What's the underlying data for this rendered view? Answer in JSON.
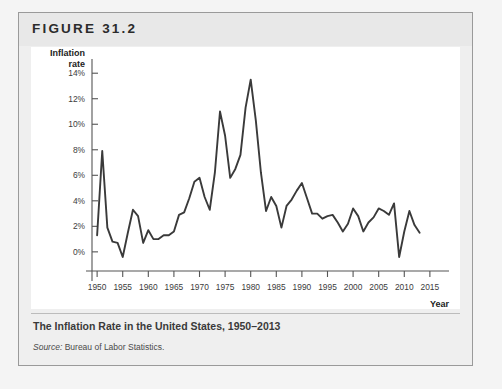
{
  "figure": {
    "label": "FIGURE 31.2",
    "caption_title": "The Inflation Rate in the United States, 1950–2013",
    "source_label": "Source:",
    "source_text": " Bureau of Labor Statistics."
  },
  "colors": {
    "line": "#3a3a3a",
    "axis": "#555555",
    "panel_background": "#ffffff",
    "header_background": "#e8e8e8",
    "box_background": "#efefef",
    "box_border": "#9a9a9a",
    "page_background": "#f4f4f4",
    "caption_rule": "#bcbcbc",
    "tick_text": "#3c3c3c"
  },
  "chart_data": {
    "type": "line",
    "title": "The Inflation Rate in the United States, 1950–2013",
    "xlabel": "Year",
    "ylabel": "Inflation rate",
    "ylabel_lines": [
      "Inflation",
      "rate"
    ],
    "xlim": [
      1949,
      2016
    ],
    "ylim": [
      -1.5,
      14.8
    ],
    "grid": false,
    "legend": "none",
    "ytick_values": [
      0,
      2,
      4,
      6,
      8,
      10,
      12,
      14
    ],
    "ytick_labels": [
      "0%",
      "2%",
      "4%",
      "6%",
      "8%",
      "10%",
      "12%",
      "14%"
    ],
    "xtick_values": [
      1950,
      1955,
      1960,
      1965,
      1970,
      1975,
      1980,
      1985,
      1990,
      1995,
      2000,
      2005,
      2010,
      2015
    ],
    "xtick_labels": [
      "1950",
      "1955",
      "1960",
      "1965",
      "1970",
      "1975",
      "1980",
      "1985",
      "1990",
      "1995",
      "2000",
      "2005",
      "2010",
      "2015"
    ],
    "series": [
      {
        "name": "US inflation rate",
        "x": [
          1950,
          1951,
          1952,
          1953,
          1954,
          1955,
          1956,
          1957,
          1958,
          1959,
          1960,
          1961,
          1962,
          1963,
          1964,
          1965,
          1966,
          1967,
          1968,
          1969,
          1970,
          1971,
          1972,
          1973,
          1974,
          1975,
          1976,
          1977,
          1978,
          1979,
          1980,
          1981,
          1982,
          1983,
          1984,
          1985,
          1986,
          1987,
          1988,
          1989,
          1990,
          1991,
          1992,
          1993,
          1994,
          1995,
          1996,
          1997,
          1998,
          1999,
          2000,
          2001,
          2002,
          2003,
          2004,
          2005,
          2006,
          2007,
          2008,
          2009,
          2010,
          2011,
          2012,
          2013
        ],
        "values": [
          1.3,
          7.9,
          1.9,
          0.8,
          0.7,
          -0.4,
          1.5,
          3.3,
          2.8,
          0.7,
          1.7,
          1.0,
          1.0,
          1.3,
          1.3,
          1.6,
          2.9,
          3.1,
          4.2,
          5.5,
          5.8,
          4.3,
          3.3,
          6.2,
          11.0,
          9.1,
          5.8,
          6.5,
          7.6,
          11.3,
          13.5,
          10.3,
          6.2,
          3.2,
          4.3,
          3.6,
          1.9,
          3.6,
          4.1,
          4.8,
          5.4,
          4.2,
          3.0,
          3.0,
          2.6,
          2.8,
          2.9,
          2.3,
          1.6,
          2.2,
          3.4,
          2.8,
          1.6,
          2.3,
          2.7,
          3.4,
          3.2,
          2.9,
          3.8,
          -0.4,
          1.6,
          3.2,
          2.1,
          1.5
        ]
      }
    ],
    "annotations": {
      "peak_1974": 11.0,
      "peak_1980": 13.5,
      "trough_1955": -0.4,
      "trough_2009": -0.4
    }
  }
}
